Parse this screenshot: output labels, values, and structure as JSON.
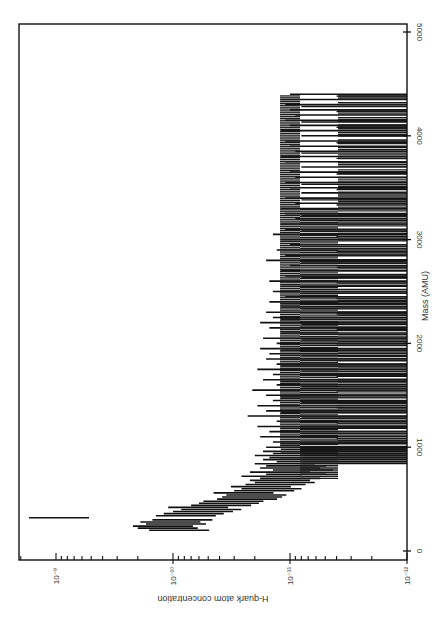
{
  "chart_data": {
    "type": "bar",
    "orientation_note": "Figure rotated 90deg clockwise: mass axis runs vertically (0 at bottom, 5000 at top) along right edge; concentration (log) runs horizontally with larger values to the left.",
    "title": "",
    "xlabel": "Mass (AMU)",
    "ylabel": "H-quark atom concentration",
    "xlim": [
      0,
      5000
    ],
    "ylim": [
      1e-12,
      2e-09
    ],
    "yscale": "log",
    "grid": false,
    "legend": null,
    "x_ticks": [
      {
        "value": 0,
        "label": "0"
      },
      {
        "value": 1000,
        "label": "1000"
      },
      {
        "value": 2000,
        "label": "2000"
      },
      {
        "value": 3000,
        "label": "3000"
      },
      {
        "value": 4000,
        "label": "4000"
      },
      {
        "value": 5000,
        "label": "5000"
      }
    ],
    "y_ticks": [
      {
        "exp": -9,
        "label": "10⁻⁹"
      },
      {
        "exp": -10,
        "label": "10⁻¹⁰"
      },
      {
        "exp": -11,
        "label": "10⁻¹¹"
      },
      {
        "exp": -12,
        "label": "10⁻¹²"
      }
    ],
    "baseline": 1e-12,
    "series": [
      {
        "name": "upper limit",
        "x": [
          200,
          220,
          240,
          260,
          280,
          300,
          320,
          340,
          360,
          380,
          400,
          420,
          440,
          460,
          480,
          500,
          520,
          540,
          560,
          580,
          600,
          620,
          640,
          660,
          680,
          700,
          720,
          740,
          760,
          780,
          800,
          820,
          840,
          860,
          880,
          900,
          920,
          940,
          960,
          980,
          1000,
          1050,
          1100,
          1150,
          1200,
          1250,
          1300,
          1350,
          1400,
          1450,
          1500,
          1550,
          1600,
          1650,
          1700,
          1750,
          1800,
          1850,
          1900,
          1950,
          2000,
          2050,
          2100,
          2150,
          2200,
          2250,
          2300,
          2350,
          2400,
          2450,
          2500,
          2550,
          2600,
          2650,
          2700,
          2750,
          2800,
          2850,
          2900,
          2950,
          3000,
          3050,
          3100,
          3150,
          3200,
          3250,
          3300,
          3350,
          3400,
          3450,
          3500,
          3550,
          3600,
          3650,
          3700,
          3750,
          3800,
          3850,
          3900,
          3950,
          4000,
          4050,
          4100,
          4150,
          4200,
          4250,
          4300,
          4350,
          4400
        ],
        "values": [
          1.6e-10,
          2e-10,
          2.2e-10,
          1.7e-10,
          1.9e-10,
          1.5e-10,
          1.7e-09,
          1.4e-10,
          1.2e-10,
          1e-10,
          8.5e-11,
          1.1e-10,
          7e-11,
          6e-11,
          5.5e-11,
          4.2e-11,
          3.8e-11,
          3.5e-11,
          4.5e-11,
          3e-11,
          2.6e-11,
          3.2e-11,
          2.4e-11,
          2e-11,
          2.2e-11,
          1.8e-11,
          2.6e-11,
          1.6e-11,
          2.2e-11,
          1.4e-11,
          1.8e-11,
          1.6e-11,
          2e-11,
          1.3e-11,
          1.7e-11,
          1.5e-11,
          2e-11,
          1.4e-11,
          1.7e-11,
          1.2e-11,
          1.6e-11,
          1.4e-11,
          1.8e-11,
          1.5e-11,
          1.9e-11,
          1.3e-11,
          2.3e-11,
          1.6e-11,
          1.9e-11,
          1.4e-11,
          1.6e-11,
          2.1e-11,
          1.3e-11,
          1.7e-11,
          1.4e-11,
          1.9e-11,
          1.3e-11,
          1.6e-11,
          1.5e-11,
          1.8e-11,
          1.3e-11,
          1.7e-11,
          1.2e-11,
          1.5e-11,
          1.8e-11,
          1.4e-11,
          1.6e-11,
          1.2e-11,
          1.5e-11,
          1.1e-11,
          1.4e-11,
          1.2e-11,
          1.5e-11,
          1.1e-11,
          1.2e-11,
          1e-11,
          1.6e-11,
          1.1e-11,
          1.3e-11,
          1e-11,
          1.2e-11,
          1.4e-11,
          1.1e-11,
          1.2e-11,
          9e-12,
          1.1e-11,
          1.2e-11,
          9e-12,
          1.1e-11,
          8e-12,
          1e-11,
          1.1e-11,
          9e-12,
          1e-11,
          8e-12,
          1.1e-11,
          1.2e-11,
          9e-12,
          1e-11,
          1.1e-11,
          8e-12,
          1.2e-11,
          1e-11,
          1.1e-11,
          9e-12,
          1e-11,
          1.1e-11,
          1.2e-11,
          1e-11
        ]
      }
    ]
  },
  "axes": {
    "xlabel": "Mass (AMU)",
    "ylabel": "H-quark atom concentration"
  }
}
